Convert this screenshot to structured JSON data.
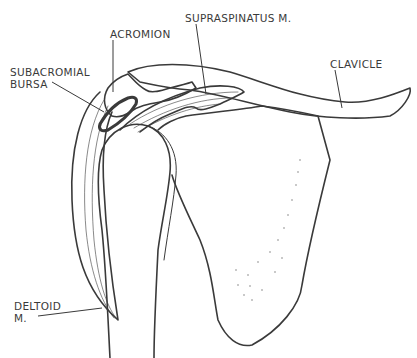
{
  "figure": {
    "labels": {
      "acromion": "ACROMION",
      "supraspinatus": "SUPRASPINATUS M.",
      "clavicle": "CLAVICLE",
      "subacromial_line1": "SUBACROMIAL",
      "subacromial_line2": "BURSA",
      "deltoid_line1": "DELTOID",
      "deltoid_line2": "M."
    },
    "colors": {
      "ink": "#3a3a3a",
      "background": "#ffffff"
    }
  }
}
